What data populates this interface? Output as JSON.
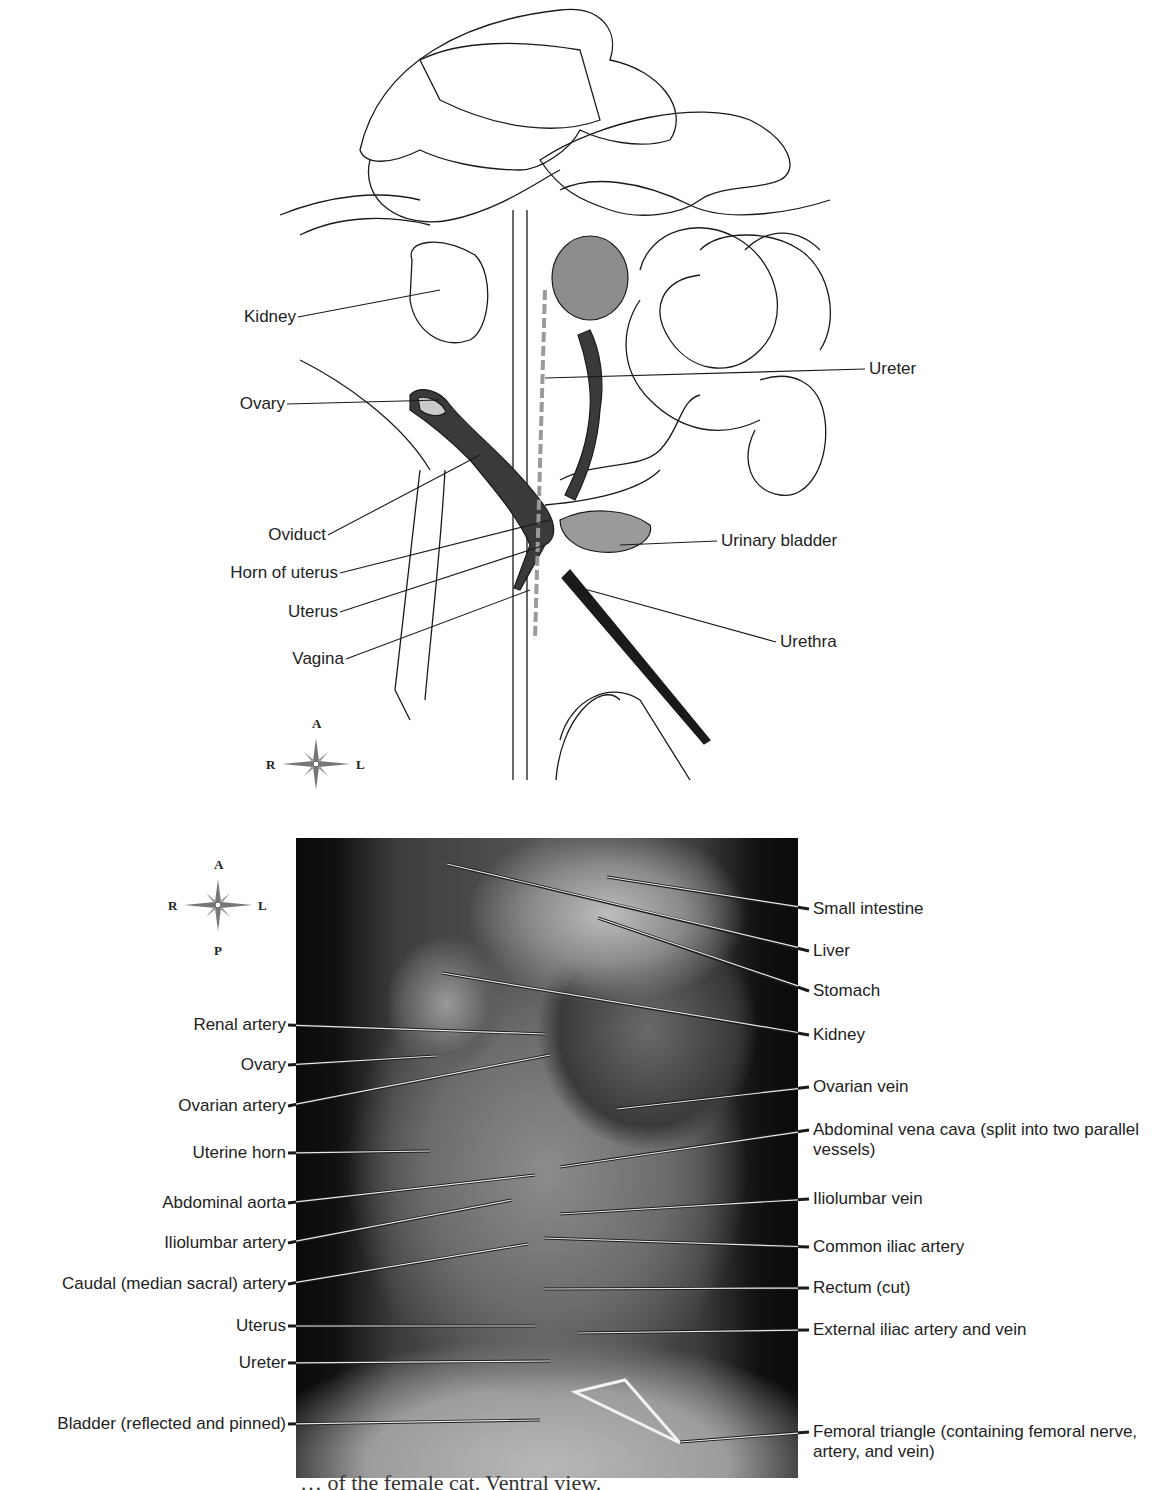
{
  "figure": {
    "caption_fragment": "… of the female cat. Ventral view."
  },
  "illustration": {
    "compass": {
      "anterior": "A",
      "posterior": "P",
      "right": "R",
      "left": "L"
    },
    "labels_left": [
      {
        "text": "Kidney",
        "x": 296,
        "y": 317,
        "target": [
          440,
          290
        ]
      },
      {
        "text": "Ovary",
        "x": 285,
        "y": 404,
        "target": [
          440,
          400
        ]
      },
      {
        "text": "Oviduct",
        "x": 326,
        "y": 535,
        "target": [
          480,
          455
        ]
      },
      {
        "text": "Horn of uterus",
        "x": 338,
        "y": 573,
        "target": [
          550,
          520
        ]
      },
      {
        "text": "Uterus",
        "x": 338,
        "y": 612,
        "target": [
          545,
          545
        ]
      },
      {
        "text": "Vagina",
        "x": 344,
        "y": 659,
        "target": [
          530,
          590
        ]
      }
    ],
    "labels_right": [
      {
        "text": "Ureter",
        "x": 869,
        "y": 369,
        "target": [
          545,
          378
        ]
      },
      {
        "text": "Urinary bladder",
        "x": 721,
        "y": 541,
        "target": [
          620,
          545
        ]
      },
      {
        "text": "Urethra",
        "x": 780,
        "y": 642,
        "target": [
          570,
          585
        ]
      }
    ]
  },
  "photo": {
    "compass": {
      "anterior": "A",
      "posterior": "P",
      "right": "R",
      "left": "L"
    },
    "labels_left": [
      {
        "text": "Renal artery",
        "x": 286,
        "y": 1025,
        "target": [
          545,
          1034
        ]
      },
      {
        "text": "Ovary",
        "x": 286,
        "y": 1065,
        "target": [
          436,
          1056
        ]
      },
      {
        "text": "Ovarian artery",
        "x": 286,
        "y": 1106,
        "target": [
          550,
          1055
        ]
      },
      {
        "text": "Uterine horn",
        "x": 286,
        "y": 1153,
        "target": [
          430,
          1151
        ]
      },
      {
        "text": "Abdominal aorta",
        "x": 286,
        "y": 1203,
        "target": [
          535,
          1175
        ]
      },
      {
        "text": "Iliolumbar artery",
        "x": 286,
        "y": 1243,
        "target": [
          512,
          1200
        ]
      },
      {
        "text": "Caudal (median sacral) artery",
        "x": 286,
        "y": 1284,
        "target": [
          528,
          1244
        ]
      },
      {
        "text": "Uterus",
        "x": 286,
        "y": 1326,
        "target": [
          535,
          1326
        ]
      },
      {
        "text": "Ureter",
        "x": 286,
        "y": 1363,
        "target": [
          550,
          1361
        ]
      },
      {
        "text": "Bladder (reflected and pinned)",
        "x": 286,
        "y": 1424,
        "target": [
          540,
          1420
        ]
      }
    ],
    "labels_right": [
      {
        "text": "Small intestine",
        "x": 813,
        "y": 909,
        "target": [
          607,
          877
        ]
      },
      {
        "text": "Liver",
        "x": 813,
        "y": 951,
        "target": [
          447,
          864
        ]
      },
      {
        "text": "Stomach",
        "x": 813,
        "y": 991,
        "target": [
          598,
          918
        ]
      },
      {
        "text": "Kidney",
        "x": 813,
        "y": 1035,
        "target": [
          442,
          973
        ]
      },
      {
        "text": "Ovarian vein",
        "x": 813,
        "y": 1087,
        "target": [
          617,
          1109
        ]
      },
      {
        "text": "Abdominal vena cava (split into two parallel vessels)",
        "x": 813,
        "y": 1130,
        "target": [
          560,
          1167
        ]
      },
      {
        "text": "Iliolumbar vein",
        "x": 813,
        "y": 1199,
        "target": [
          560,
          1214
        ]
      },
      {
        "text": "Common iliac artery",
        "x": 813,
        "y": 1247,
        "target": [
          544,
          1238
        ]
      },
      {
        "text": "Rectum (cut)",
        "x": 813,
        "y": 1288,
        "target": [
          544,
          1289
        ]
      },
      {
        "text": "External iliac artery and vein",
        "x": 813,
        "y": 1330,
        "target": [
          578,
          1333
        ]
      },
      {
        "text": "Femoral triangle (containing femoral nerve, artery, and vein)",
        "x": 813,
        "y": 1432,
        "target": [
          680,
          1442
        ]
      }
    ]
  },
  "colors": {
    "ink": "#1a1a1a",
    "organ_fill": "#8d8d8d",
    "vessel_dark": "#3a3a3a",
    "photo_dark": "#0b0b0b",
    "leader_light": "#e8e8e8"
  }
}
